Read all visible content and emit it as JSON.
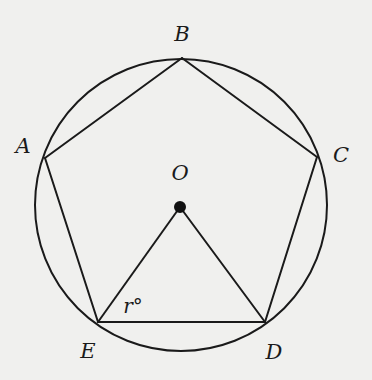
{
  "diagram": {
    "type": "inscribed-regular-pentagon",
    "colors": {
      "background": "#f0f0ee",
      "stroke": "#1a1a1a"
    },
    "circle": {
      "cx": 181,
      "cy": 205,
      "r": 146
    },
    "center": {
      "label": "O",
      "x": 180,
      "y": 207,
      "dot_r": 6
    },
    "vertices": [
      {
        "label": "A",
        "x": 45,
        "y": 158,
        "lx": 23,
        "ly": 146
      },
      {
        "label": "B",
        "x": 182,
        "y": 58,
        "lx": 182,
        "ly": 34
      },
      {
        "label": "C",
        "x": 317,
        "y": 157,
        "lx": 341,
        "ly": 155
      },
      {
        "label": "D",
        "x": 265,
        "y": 322,
        "lx": 274,
        "ly": 352
      },
      {
        "label": "E",
        "x": 98,
        "y": 322,
        "lx": 88,
        "ly": 351
      }
    ],
    "segments": [
      [
        "A",
        "B"
      ],
      [
        "B",
        "C"
      ],
      [
        "C",
        "D"
      ],
      [
        "D",
        "E"
      ],
      [
        "E",
        "A"
      ],
      [
        "O",
        "E"
      ],
      [
        "O",
        "D"
      ]
    ],
    "angle_label": {
      "text": "r°",
      "x": 133,
      "y": 306,
      "at_vertex": "E"
    },
    "center_label_pos": {
      "x": 180,
      "y": 173
    }
  }
}
